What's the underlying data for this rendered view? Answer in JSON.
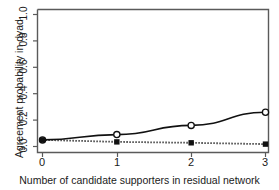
{
  "chart_data": {
    "type": "line",
    "title": "..",
    "xlabel": "Number of candidate supporters in residual network",
    "ylabel": "Agreement probability in dyad",
    "x": [
      0,
      1,
      2,
      3
    ],
    "xlim": [
      -0.18,
      3.18
    ],
    "ylim": [
      0.0,
      1.07
    ],
    "xticks": [
      "0",
      "1",
      "2",
      "3"
    ],
    "yticks": [
      "0.0",
      "0.2",
      "0.4",
      "0.6",
      "0.8",
      "1.0"
    ],
    "ytick_values": [
      0.0,
      0.2,
      0.4,
      0.6,
      0.8,
      1.0
    ],
    "grid": false,
    "legend": "none",
    "series": [
      {
        "name": "open-circle-solid",
        "marker": "open circle",
        "linestyle": "solid",
        "color": "#111111",
        "values": [
          0.05,
          0.09,
          0.16,
          0.26
        ]
      },
      {
        "name": "filled-square-dotted",
        "marker": "filled square",
        "linestyle": "dotted",
        "color": "#111111",
        "values": [
          0.05,
          0.035,
          0.028,
          0.018
        ]
      }
    ]
  },
  "figure": {
    "background_color": "#ffffff",
    "axis_color": "#555555"
  }
}
